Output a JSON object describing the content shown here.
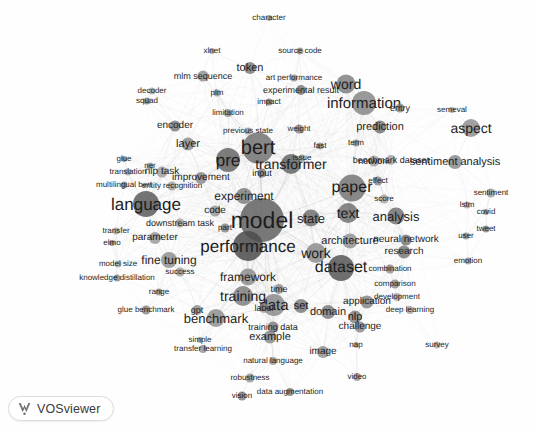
{
  "app": {
    "name": "VOSviewer",
    "logo_icon": "vosviewer-logo-icon"
  },
  "canvas": {
    "width": 533,
    "height": 433,
    "background_color": "#fefefe",
    "node_color": "#8c8c8c",
    "edge_color": "#b4b4b4",
    "label_color": "#1d1d1d"
  },
  "chart_data": {
    "type": "scatter",
    "title": "",
    "subtitle": "",
    "xlabel": "",
    "ylabel": "",
    "grid": false,
    "legend_position": "none",
    "rendering": "term co-occurrence network map (VOSviewer)",
    "xlim": [
      0,
      533
    ],
    "ylim": [
      0,
      433
    ],
    "nodes": [
      {
        "label": "model",
        "x": 262,
        "y": 220,
        "size": 44,
        "font": 23
      },
      {
        "label": "bert",
        "x": 258,
        "y": 148,
        "size": 31,
        "font": 20
      },
      {
        "label": "pre",
        "x": 228,
        "y": 160,
        "size": 24,
        "font": 17
      },
      {
        "label": "language",
        "x": 146,
        "y": 204,
        "size": 26,
        "font": 17
      },
      {
        "label": "performance",
        "x": 248,
        "y": 246,
        "size": 30,
        "font": 17
      },
      {
        "label": "dataset",
        "x": 341,
        "y": 268,
        "size": 26,
        "font": 16
      },
      {
        "label": "paper",
        "x": 352,
        "y": 188,
        "size": 27,
        "font": 16
      },
      {
        "label": "information",
        "x": 364,
        "y": 103,
        "size": 24,
        "font": 15
      },
      {
        "label": "transformer",
        "x": 291,
        "y": 164,
        "size": 20,
        "font": 14
      },
      {
        "label": "data",
        "x": 274,
        "y": 305,
        "size": 22,
        "font": 15
      },
      {
        "label": "work",
        "x": 316,
        "y": 253,
        "size": 20,
        "font": 14
      },
      {
        "label": "text",
        "x": 348,
        "y": 213,
        "size": 20,
        "font": 14
      },
      {
        "label": "training",
        "x": 243,
        "y": 296,
        "size": 20,
        "font": 14
      },
      {
        "label": "benchmark",
        "x": 216,
        "y": 318,
        "size": 18,
        "font": 13
      },
      {
        "label": "word",
        "x": 346,
        "y": 84,
        "size": 19,
        "font": 14
      },
      {
        "label": "analysis",
        "x": 396,
        "y": 216,
        "size": 17,
        "font": 13
      },
      {
        "label": "experiment",
        "x": 244,
        "y": 196,
        "size": 16,
        "font": 12
      },
      {
        "label": "framework",
        "x": 248,
        "y": 277,
        "size": 17,
        "font": 12
      },
      {
        "label": "state",
        "x": 311,
        "y": 218,
        "size": 17,
        "font": 13
      },
      {
        "label": "aspect",
        "x": 471,
        "y": 128,
        "size": 18,
        "font": 14
      },
      {
        "label": "sentiment analysis",
        "x": 455,
        "y": 162,
        "size": 14,
        "font": 11
      },
      {
        "label": "architecture",
        "x": 350,
        "y": 241,
        "size": 15,
        "font": 11
      },
      {
        "label": "fine tuning",
        "x": 169,
        "y": 260,
        "size": 16,
        "font": 12
      },
      {
        "label": "domain",
        "x": 328,
        "y": 312,
        "size": 14,
        "font": 11
      },
      {
        "label": "set",
        "x": 301,
        "y": 306,
        "size": 14,
        "font": 11
      },
      {
        "label": "nlp",
        "x": 355,
        "y": 317,
        "size": 13,
        "font": 11
      },
      {
        "label": "example",
        "x": 270,
        "y": 337,
        "size": 13,
        "font": 11
      },
      {
        "label": "training data",
        "x": 273,
        "y": 327,
        "size": 11,
        "font": 9
      },
      {
        "label": "prediction",
        "x": 380,
        "y": 127,
        "size": 13,
        "font": 11
      },
      {
        "label": "application",
        "x": 367,
        "y": 302,
        "size": 13,
        "font": 10
      },
      {
        "label": "improvement",
        "x": 201,
        "y": 178,
        "size": 12,
        "font": 10
      },
      {
        "label": "research",
        "x": 404,
        "y": 252,
        "size": 13,
        "font": 10
      },
      {
        "label": "layer",
        "x": 188,
        "y": 144,
        "size": 13,
        "font": 11
      },
      {
        "label": "neural network",
        "x": 406,
        "y": 240,
        "size": 11,
        "font": 10
      },
      {
        "label": "nlp task",
        "x": 162,
        "y": 172,
        "size": 11,
        "font": 10
      },
      {
        "label": "image",
        "x": 323,
        "y": 352,
        "size": 12,
        "font": 10
      },
      {
        "label": "parameter",
        "x": 155,
        "y": 238,
        "size": 12,
        "font": 10
      },
      {
        "label": "code",
        "x": 215,
        "y": 211,
        "size": 11,
        "font": 10
      },
      {
        "label": "token",
        "x": 250,
        "y": 68,
        "size": 12,
        "font": 11
      },
      {
        "label": "challenge",
        "x": 360,
        "y": 327,
        "size": 11,
        "font": 10
      },
      {
        "label": "network",
        "x": 374,
        "y": 161,
        "size": 11,
        "font": 9
      },
      {
        "label": "encoder",
        "x": 175,
        "y": 126,
        "size": 11,
        "font": 10
      },
      {
        "label": "time",
        "x": 279,
        "y": 289,
        "size": 10,
        "font": 9
      },
      {
        "label": "label",
        "x": 264,
        "y": 308,
        "size": 10,
        "font": 9
      },
      {
        "label": "mlm sequence",
        "x": 203,
        "y": 76,
        "size": 11,
        "font": 9
      },
      {
        "label": "experimental result",
        "x": 301,
        "y": 90,
        "size": 10,
        "font": 9
      },
      {
        "label": "entity recognition",
        "x": 172,
        "y": 186,
        "size": 9,
        "font": 8
      },
      {
        "label": "downstream task",
        "x": 180,
        "y": 223,
        "size": 9,
        "font": 9
      },
      {
        "label": "benchmark dataset",
        "x": 391,
        "y": 160,
        "size": 10,
        "font": 9
      },
      {
        "label": "success",
        "x": 180,
        "y": 272,
        "size": 9,
        "font": 8
      },
      {
        "label": "part",
        "x": 225,
        "y": 228,
        "size": 9,
        "font": 8
      },
      {
        "label": "score",
        "x": 384,
        "y": 199,
        "size": 9,
        "font": 8
      },
      {
        "label": "effect",
        "x": 378,
        "y": 181,
        "size": 9,
        "font": 8
      },
      {
        "label": "entry",
        "x": 400,
        "y": 108,
        "size": 9,
        "font": 9
      },
      {
        "label": "input",
        "x": 262,
        "y": 173,
        "size": 9,
        "font": 9
      },
      {
        "label": "glue benchmark",
        "x": 146,
        "y": 310,
        "size": 9,
        "font": 8
      },
      {
        "label": "gpt",
        "x": 197,
        "y": 310,
        "size": 10,
        "font": 9
      },
      {
        "label": "weight",
        "x": 299,
        "y": 129,
        "size": 9,
        "font": 8
      },
      {
        "label": "combination",
        "x": 390,
        "y": 269,
        "size": 9,
        "font": 8
      },
      {
        "label": "comparison",
        "x": 395,
        "y": 284,
        "size": 9,
        "font": 8
      },
      {
        "label": "development",
        "x": 397,
        "y": 297,
        "size": 8,
        "font": 8
      },
      {
        "label": "deep learning",
        "x": 410,
        "y": 310,
        "size": 8,
        "font": 8
      },
      {
        "label": "transfer learning",
        "x": 203,
        "y": 349,
        "size": 8,
        "font": 8
      },
      {
        "label": "natural language",
        "x": 273,
        "y": 361,
        "size": 8,
        "font": 8
      },
      {
        "label": "data augmentation",
        "x": 290,
        "y": 392,
        "size": 8,
        "font": 8
      },
      {
        "label": "robustness",
        "x": 250,
        "y": 378,
        "size": 9,
        "font": 8
      },
      {
        "label": "vision",
        "x": 242,
        "y": 396,
        "size": 9,
        "font": 8
      },
      {
        "label": "video",
        "x": 357,
        "y": 377,
        "size": 8,
        "font": 8
      },
      {
        "label": "survey",
        "x": 437,
        "y": 345,
        "size": 7,
        "font": 8
      },
      {
        "label": "emotion",
        "x": 468,
        "y": 261,
        "size": 7,
        "font": 8
      },
      {
        "label": "sentiment",
        "x": 491,
        "y": 193,
        "size": 9,
        "font": 8
      },
      {
        "label": "tweet",
        "x": 486,
        "y": 229,
        "size": 7,
        "font": 8
      },
      {
        "label": "user",
        "x": 466,
        "y": 236,
        "size": 7,
        "font": 8
      },
      {
        "label": "lstm",
        "x": 467,
        "y": 205,
        "size": 7,
        "font": 8
      },
      {
        "label": "covid",
        "x": 486,
        "y": 212,
        "size": 6,
        "font": 8
      },
      {
        "label": "semeval",
        "x": 452,
        "y": 110,
        "size": 6,
        "font": 8
      },
      {
        "label": "character",
        "x": 269,
        "y": 18,
        "size": 6,
        "font": 8
      },
      {
        "label": "source code",
        "x": 300,
        "y": 51,
        "size": 7,
        "font": 8
      },
      {
        "label": "xlnet",
        "x": 212,
        "y": 51,
        "size": 6,
        "font": 8
      },
      {
        "label": "art performance",
        "x": 294,
        "y": 78,
        "size": 7,
        "font": 8
      },
      {
        "label": "impact",
        "x": 269,
        "y": 102,
        "size": 7,
        "font": 8
      },
      {
        "label": "plm",
        "x": 217,
        "y": 93,
        "size": 7,
        "font": 8
      },
      {
        "label": "limitation",
        "x": 228,
        "y": 113,
        "size": 8,
        "font": 8
      },
      {
        "label": "previous state",
        "x": 248,
        "y": 131,
        "size": 7,
        "font": 8
      },
      {
        "label": "decoder",
        "x": 152,
        "y": 91,
        "size": 7,
        "font": 8
      },
      {
        "label": "squad",
        "x": 147,
        "y": 101,
        "size": 7,
        "font": 8
      },
      {
        "label": "ner",
        "x": 150,
        "y": 166,
        "size": 7,
        "font": 8
      },
      {
        "label": "glue",
        "x": 124,
        "y": 159,
        "size": 6,
        "font": 8
      },
      {
        "label": "translation",
        "x": 128,
        "y": 172,
        "size": 7,
        "font": 8
      },
      {
        "label": "multilingual bert",
        "x": 124,
        "y": 185,
        "size": 7,
        "font": 8
      },
      {
        "label": "transfer",
        "x": 116,
        "y": 231,
        "size": 7,
        "font": 8
      },
      {
        "label": "elmo",
        "x": 112,
        "y": 243,
        "size": 6,
        "font": 8
      },
      {
        "label": "model size",
        "x": 118,
        "y": 264,
        "size": 7,
        "font": 8
      },
      {
        "label": "knowledge distillation",
        "x": 117,
        "y": 278,
        "size": 7,
        "font": 8
      },
      {
        "label": "range",
        "x": 159,
        "y": 292,
        "size": 7,
        "font": 8
      },
      {
        "label": "simple",
        "x": 200,
        "y": 340,
        "size": 6,
        "font": 8
      },
      {
        "label": "issue",
        "x": 302,
        "y": 158,
        "size": 7,
        "font": 8
      },
      {
        "label": "fast",
        "x": 320,
        "y": 146,
        "size": 7,
        "font": 8
      },
      {
        "label": "term",
        "x": 356,
        "y": 143,
        "size": 7,
        "font": 8
      },
      {
        "label": "nap",
        "x": 356,
        "y": 345,
        "size": 6,
        "font": 8
      }
    ],
    "edges_description": "dense light-gray co-occurrence links radiating from the central cluster (model, bert, performance, dataset) outward to peripheral terms",
    "clusters": [
      {
        "name": "pretraining / language models",
        "terms": [
          "bert",
          "pre",
          "transformer",
          "token",
          "encoder",
          "decoder",
          "layer",
          "xlnet",
          "plm",
          "mlm sequence",
          "previous state",
          "squad",
          "weight",
          "input"
        ]
      },
      {
        "name": "evaluation / training",
        "terms": [
          "model",
          "performance",
          "experiment",
          "training",
          "benchmark",
          "framework",
          "code",
          "glue benchmark",
          "gpt",
          "fine tuning",
          "parameter",
          "success",
          "range",
          "model size",
          "knowledge distillation",
          "transfer",
          "elmo"
        ]
      },
      {
        "name": "data / applications",
        "terms": [
          "dataset",
          "data",
          "set",
          "domain",
          "label",
          "example",
          "training data",
          "image",
          "video",
          "vision",
          "data augmentation",
          "natural language",
          "robustness",
          "nlp",
          "challenge",
          "application"
        ]
      },
      {
        "name": "analysis / sentiment",
        "terms": [
          "sentiment analysis",
          "sentiment",
          "aspect",
          "semeval",
          "lstm",
          "covid",
          "tweet",
          "user",
          "emotion",
          "survey",
          "analysis",
          "research",
          "neural network",
          "comparison",
          "combination",
          "development",
          "deep learning"
        ]
      },
      {
        "name": "papers / information",
        "terms": [
          "paper",
          "information",
          "word",
          "prediction",
          "entry",
          "text",
          "state",
          "work",
          "score",
          "effect",
          "network",
          "term",
          "benchmark dataset",
          "source code",
          "art performance",
          "experimental result",
          "impact",
          "character",
          "limitation"
        ]
      }
    ]
  }
}
